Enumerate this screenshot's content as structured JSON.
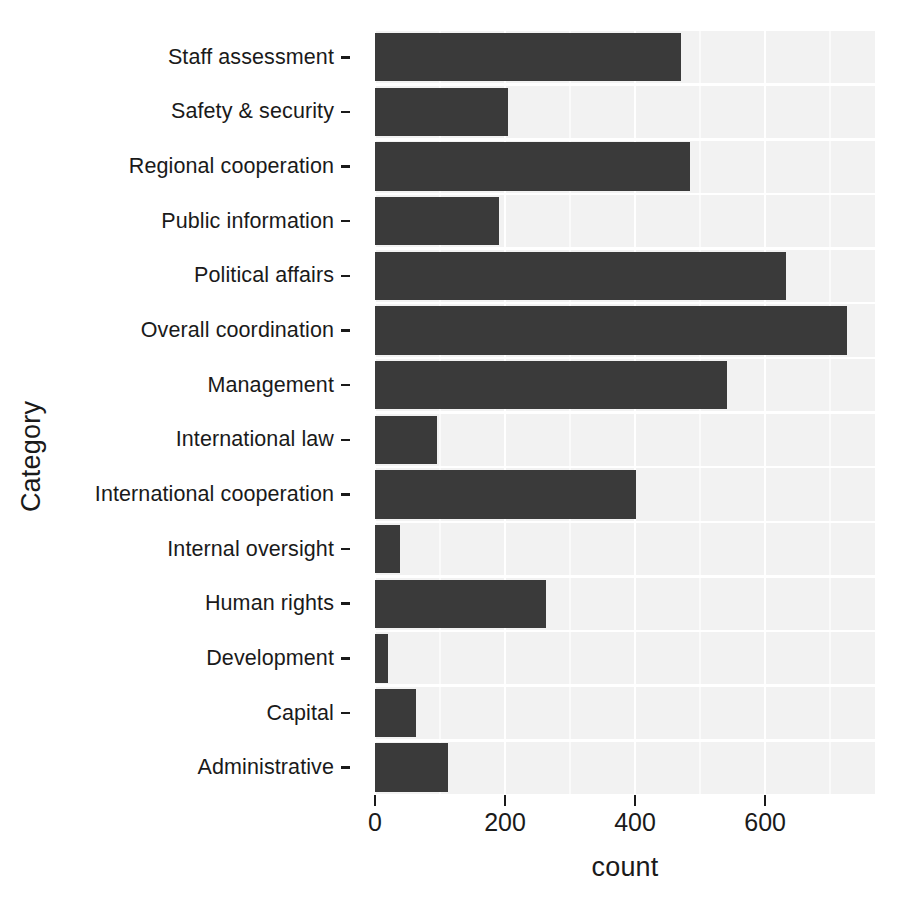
{
  "chart_data": {
    "type": "bar",
    "orientation": "horizontal",
    "title": "",
    "xlabel": "count",
    "ylabel": "Category",
    "xlim": [
      0,
      769
    ],
    "xticks": [
      0,
      200,
      400,
      600
    ],
    "xtick_labels": [
      "0",
      "200",
      "400",
      "600"
    ],
    "grid": true,
    "legend": "none",
    "bar_color": "#3a3a3a",
    "panel_color": "#f2f2f2",
    "gridline_color": "#ffffff",
    "categories": [
      "Staff assessment",
      "Safety & security",
      "Regional cooperation",
      "Public information",
      "Political affairs",
      "Overall coordination",
      "Management",
      "International law",
      "International cooperation",
      "Internal oversight",
      "Human rights",
      "Development",
      "Capital",
      "Administrative"
    ],
    "values": [
      470,
      205,
      485,
      190,
      632,
      726,
      542,
      95,
      402,
      38,
      263,
      20,
      63,
      113
    ]
  }
}
